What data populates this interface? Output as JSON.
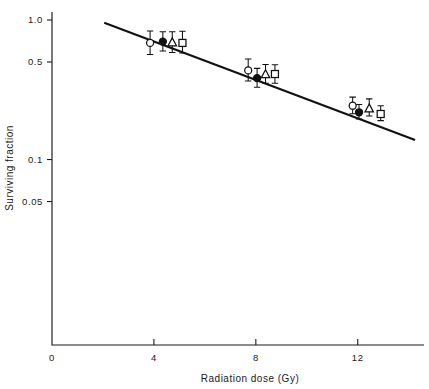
{
  "chart_data": {
    "type": "scatter",
    "title": "",
    "xlabel": "Radiation dose (Gy)",
    "ylabel": "Surviving fraction",
    "yscale": "log",
    "xlim": [
      0,
      14.6
    ],
    "ylim": [
      0.02,
      1.15
    ],
    "xticks": [
      0,
      4,
      8,
      12
    ],
    "xtick_labels": [
      "0",
      "4",
      "8",
      "12"
    ],
    "yticks": [
      1.0,
      0.5,
      0.1,
      0.05
    ],
    "ytick_labels": [
      "1.0",
      "0.5",
      "0.1",
      "0.05"
    ],
    "grid": false,
    "legend": "none",
    "series": [
      {
        "name": "open-circle",
        "marker": "circle-open",
        "points": [
          {
            "x": 3.85,
            "y": 0.685,
            "yerr_low": 0.565,
            "yerr_high": 0.835
          },
          {
            "x": 7.7,
            "y": 0.435,
            "yerr_low": 0.365,
            "yerr_high": 0.525
          },
          {
            "x": 11.8,
            "y": 0.243,
            "yerr_low": 0.213,
            "yerr_high": 0.28
          }
        ]
      },
      {
        "name": "filled-circle",
        "marker": "circle-filled",
        "points": [
          {
            "x": 4.35,
            "y": 0.7,
            "yerr_low": 0.6,
            "yerr_high": 0.825
          },
          {
            "x": 8.05,
            "y": 0.383,
            "yerr_low": 0.33,
            "yerr_high": 0.45
          },
          {
            "x": 12.05,
            "y": 0.218,
            "yerr_low": 0.195,
            "yerr_high": 0.248
          }
        ]
      },
      {
        "name": "open-triangle",
        "marker": "triangle-open",
        "points": [
          {
            "x": 4.72,
            "y": 0.69,
            "yerr_low": 0.585,
            "yerr_high": 0.825
          },
          {
            "x": 8.38,
            "y": 0.408,
            "yerr_low": 0.352,
            "yerr_high": 0.48
          },
          {
            "x": 12.45,
            "y": 0.232,
            "yerr_low": 0.205,
            "yerr_high": 0.272
          }
        ]
      },
      {
        "name": "open-square",
        "marker": "square-open",
        "points": [
          {
            "x": 5.12,
            "y": 0.685,
            "yerr_low": 0.58,
            "yerr_high": 0.83
          },
          {
            "x": 8.75,
            "y": 0.41,
            "yerr_low": 0.352,
            "yerr_high": 0.478
          },
          {
            "x": 12.9,
            "y": 0.212,
            "yerr_low": 0.19,
            "yerr_high": 0.243
          }
        ]
      }
    ],
    "fit_line": {
      "name": "regression-line",
      "x_start": 2.05,
      "y_start": 0.955,
      "x_end": 14.25,
      "y_end": 0.138
    }
  },
  "axes": {
    "x_title": "Radiation dose (Gy)",
    "y_title": "Surviving fraction"
  }
}
